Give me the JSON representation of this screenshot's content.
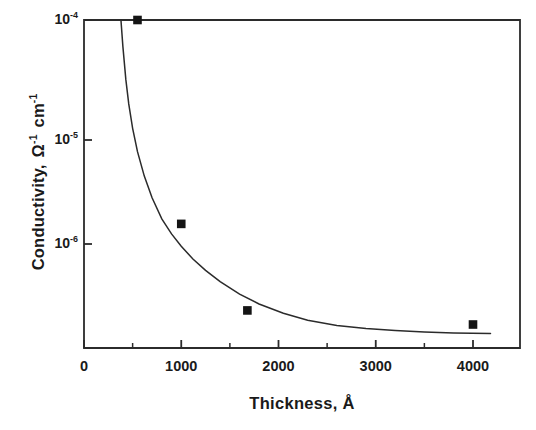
{
  "chart_data": {
    "type": "scatter",
    "title": "",
    "xlabel": "Thickness, Å",
    "ylabel": "Conductivity,  Ω⁻¹ cm⁻¹",
    "ylabel_parts": {
      "name": "Conductivity,",
      "unit_base_1": "Ω",
      "unit_exp_1": "-1",
      "unit_base_2": "cm",
      "unit_exp_2": "-1"
    },
    "xscale": "linear",
    "yscale": "log",
    "xlim": [
      0,
      4480
    ],
    "ylim": [
      1.35e-07,
      0.0001
    ],
    "grid": false,
    "legend": null,
    "xticks": [
      0,
      1000,
      2000,
      3000,
      4000
    ],
    "xtick_labels": [
      "0",
      "1000",
      "2000",
      "3000",
      "4000"
    ],
    "x_minor_ticks": [
      500,
      1500,
      2500,
      3500
    ],
    "yticks": [
      0.0001,
      1e-05,
      1e-06
    ],
    "ytick_labels": [
      "10-4",
      "10-5",
      "10-6"
    ],
    "ytick_mantissa": [
      "10",
      "10",
      "10"
    ],
    "ytick_exponents": [
      "-4",
      "-5",
      "-6"
    ],
    "marker_style": "filled-square",
    "marker_color": "#141414",
    "line_color": "#2b2b2b",
    "axis_color": "#2b2b2b",
    "points": [
      {
        "x": 550,
        "y": 0.0001
      },
      {
        "x": 1000,
        "y": 2e-06
      },
      {
        "x": 1680,
        "y": 3.8e-07
      },
      {
        "x": 4000,
        "y": 2.9e-07
      }
    ],
    "fit_curve": {
      "description": "monotonic decreasing fit approaching asymptote",
      "asymptote_y": 2.4e-07,
      "x_start": 380,
      "x_end": 4180,
      "x": [
        380,
        400,
        430,
        460,
        500,
        550,
        620,
        700,
        800,
        900,
        1000,
        1120,
        1250,
        1400,
        1600,
        1800,
        2050,
        2300,
        2600,
        2900,
        3200,
        3500,
        3800,
        4180
      ],
      "y": [
        0.0001,
        6e-05,
        3.2e-05,
        2e-05,
        1.25e-05,
        8e-06,
        5e-06,
        3.3e-06,
        2.2e-06,
        1.65e-06,
        1.3e-06,
        1.02e-06,
        8.2e-07,
        6.6e-07,
        5.2e-07,
        4.3e-07,
        3.6e-07,
        3.15e-07,
        2.85e-07,
        2.68e-07,
        2.58e-07,
        2.51e-07,
        2.47e-07,
        2.44e-07
      ]
    }
  },
  "geometry": {
    "plot_left": 84,
    "plot_right": 520,
    "plot_top": 20,
    "plot_bottom": 348,
    "y_px_1em4": 20,
    "y_px_1em5": 140,
    "y_px_1em6": 244,
    "x_px_per_unit": 0.09725
  },
  "colors": {
    "background": "#ffffff",
    "ink": "#1a1a1a",
    "axis": "#2b2b2b",
    "marker": "#141414"
  }
}
